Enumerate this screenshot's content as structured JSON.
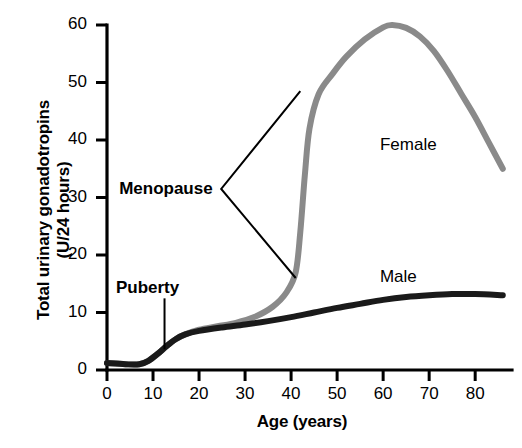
{
  "chart_data": {
    "type": "line",
    "title": "",
    "xlabel": "Age (years)",
    "ylabel": "Total urinary gonadotropins (U/24 hours)",
    "ylabel_line1": "Total urinary gonadotropins",
    "ylabel_line2": "(U/24 hours)",
    "xlim": [
      0,
      88
    ],
    "ylim": [
      0,
      60
    ],
    "xticks": [
      0,
      10,
      20,
      30,
      40,
      50,
      60,
      70,
      80
    ],
    "yticks": [
      0,
      10,
      20,
      30,
      40,
      50,
      60
    ],
    "grid": false,
    "legend": "inline-labels",
    "series": [
      {
        "name": "Female",
        "color": "#8a8a8a",
        "label_x": 68,
        "label_y": 39,
        "x": [
          0,
          4,
          7,
          9,
          11,
          13,
          15,
          17,
          20,
          24,
          28,
          32,
          36,
          39,
          41,
          42,
          43,
          44,
          46,
          49,
          52,
          56,
          60,
          62,
          65,
          68,
          71,
          74,
          77,
          80,
          83,
          86
        ],
        "y": [
          1.2,
          1.0,
          1.0,
          1.6,
          2.8,
          4.2,
          5.4,
          6.2,
          7.0,
          7.6,
          8.2,
          9.2,
          11.0,
          13.5,
          17.0,
          24.0,
          34.0,
          42.0,
          48.0,
          51.5,
          54.5,
          57.5,
          59.6,
          60.0,
          59.5,
          58.0,
          55.5,
          52.0,
          48.0,
          44.0,
          39.5,
          35.0
        ]
      },
      {
        "name": "Male",
        "color": "#1a1a1a",
        "label_x": 68,
        "label_y": 16,
        "x": [
          0,
          4,
          7,
          9,
          11,
          13,
          15,
          17,
          20,
          25,
          30,
          35,
          40,
          45,
          50,
          55,
          60,
          65,
          70,
          75,
          80,
          86
        ],
        "y": [
          1.2,
          1.0,
          1.0,
          1.6,
          2.8,
          4.2,
          5.4,
          6.2,
          6.8,
          7.4,
          7.9,
          8.5,
          9.2,
          10.0,
          10.8,
          11.5,
          12.2,
          12.7,
          13.0,
          13.2,
          13.2,
          13.0
        ]
      }
    ],
    "annotations": [
      {
        "text": "Puberty",
        "kind": "pointer-line",
        "label_x": 11.5,
        "label_y": 14.2,
        "point_x": 12.5,
        "point_y": 3.6
      },
      {
        "text": "Menopause",
        "kind": "bracket",
        "label_x": 23.5,
        "label_y": 31.5,
        "point1_x": 42.0,
        "point1_y": 48.5,
        "point2_x": 41.0,
        "point2_y": 16.0
      }
    ]
  }
}
